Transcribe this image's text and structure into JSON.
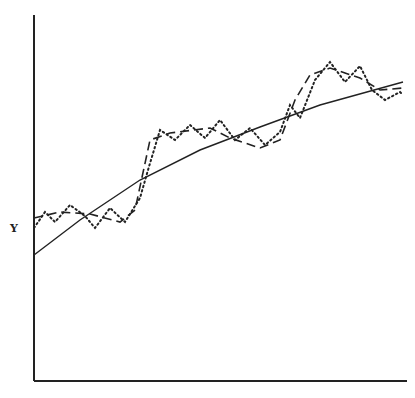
{
  "chart_data": {
    "type": "line",
    "title": "",
    "xlabel": "",
    "ylabel": "Y",
    "grid": false,
    "legend": null,
    "series": [
      {
        "name": "trend (solid)",
        "style": "solid",
        "points": [
          [
            34,
            255
          ],
          [
            80,
            220
          ],
          [
            140,
            180
          ],
          [
            200,
            150
          ],
          [
            260,
            127
          ],
          [
            320,
            105
          ],
          [
            403,
            82
          ]
        ]
      },
      {
        "name": "stepped cycle (dashed)",
        "style": "dashed",
        "points": [
          [
            34,
            218
          ],
          [
            60,
            212
          ],
          [
            90,
            214
          ],
          [
            120,
            222
          ],
          [
            135,
            210
          ],
          [
            150,
            140
          ],
          [
            170,
            133
          ],
          [
            210,
            128
          ],
          [
            230,
            138
          ],
          [
            260,
            148
          ],
          [
            280,
            140
          ],
          [
            295,
            100
          ],
          [
            310,
            75
          ],
          [
            330,
            68
          ],
          [
            360,
            78
          ],
          [
            380,
            90
          ],
          [
            403,
            88
          ]
        ]
      },
      {
        "name": "short cycle (dotted)",
        "style": "dotted",
        "points": [
          [
            34,
            228
          ],
          [
            45,
            212
          ],
          [
            55,
            222
          ],
          [
            70,
            205
          ],
          [
            85,
            216
          ],
          [
            95,
            228
          ],
          [
            110,
            208
          ],
          [
            125,
            222
          ],
          [
            140,
            198
          ],
          [
            148,
            170
          ],
          [
            160,
            130
          ],
          [
            175,
            140
          ],
          [
            190,
            125
          ],
          [
            205,
            138
          ],
          [
            220,
            120
          ],
          [
            235,
            140
          ],
          [
            250,
            128
          ],
          [
            265,
            145
          ],
          [
            280,
            132
          ],
          [
            290,
            105
          ],
          [
            300,
            118
          ],
          [
            315,
            80
          ],
          [
            330,
            62
          ],
          [
            345,
            82
          ],
          [
            360,
            66
          ],
          [
            372,
            90
          ],
          [
            385,
            100
          ],
          [
            400,
            92
          ],
          [
            403,
            95
          ]
        ]
      }
    ]
  },
  "axes": {
    "y_label": "Y"
  }
}
